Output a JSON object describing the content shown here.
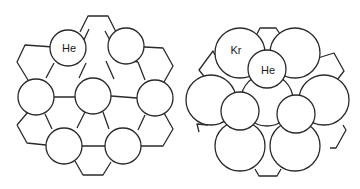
{
  "figure": {
    "left_panel": {
      "description": "Helium atoms in a hexagonal honeycomb lattice",
      "atom_label": "He",
      "atoms": [
        {
          "label": "He",
          "cx": 68,
          "cy": 48,
          "r": 18
        },
        {
          "label": "",
          "cx": 126,
          "cy": 46,
          "r": 18
        },
        {
          "label": "",
          "cx": 36,
          "cy": 97,
          "r": 18
        },
        {
          "label": "",
          "cx": 93,
          "cy": 96,
          "r": 18
        },
        {
          "label": "",
          "cx": 155,
          "cy": 98,
          "r": 18
        },
        {
          "label": "",
          "cx": 64,
          "cy": 146,
          "r": 18
        },
        {
          "label": "",
          "cx": 123,
          "cy": 146,
          "r": 18
        }
      ]
    },
    "right_panel": {
      "description": "Krypton atoms (large) with helium atoms (small) adsorbed on a hexagonal lattice",
      "large_atom_label": "Kr",
      "small_atom_label": "He",
      "large_atoms": [
        {
          "label": "Kr",
          "cx": 240,
          "cy": 53,
          "r": 25
        },
        {
          "label": "",
          "cx": 295,
          "cy": 53,
          "r": 25
        },
        {
          "label": "",
          "cx": 211,
          "cy": 100,
          "r": 25
        },
        {
          "label": "",
          "cx": 267,
          "cy": 100,
          "r": 26
        },
        {
          "label": "",
          "cx": 324,
          "cy": 100,
          "r": 25
        },
        {
          "label": "",
          "cx": 240,
          "cy": 146,
          "r": 25
        },
        {
          "label": "",
          "cx": 295,
          "cy": 146,
          "r": 25
        }
      ],
      "small_atoms": [
        {
          "label": "He",
          "cx": 267,
          "cy": 69,
          "r": 19
        },
        {
          "label": "",
          "cx": 240,
          "cy": 111,
          "r": 19
        },
        {
          "label": "",
          "cx": 296,
          "cy": 114,
          "r": 19
        }
      ]
    }
  }
}
